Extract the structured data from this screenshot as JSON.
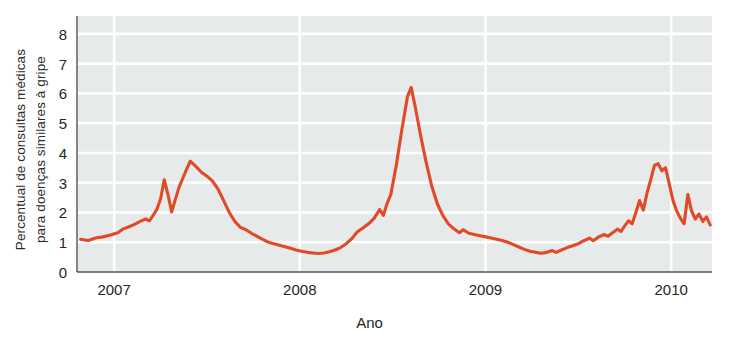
{
  "chart_data": {
    "type": "line",
    "title": "",
    "xlabel": "Ano",
    "ylabel": "Percentual de consultas médicas para doenças similares à gripe",
    "ylabel_line1": "Percentual de consultas médicas",
    "ylabel_line2": "para doenças similares à gripe",
    "ylim": [
      0,
      8.6
    ],
    "xlim": [
      2006.8,
      2010.22
    ],
    "yticks": [
      0,
      1,
      2,
      3,
      4,
      5,
      6,
      7,
      8
    ],
    "ytick_labels": [
      "0",
      "1",
      "2",
      "3",
      "4",
      "5",
      "6",
      "7",
      "8"
    ],
    "xticks": [
      2007,
      2008,
      2009,
      2010
    ],
    "xtick_labels": [
      "2007",
      "2008",
      "2009",
      "2010"
    ],
    "grid": "horizontal-and-vertical-white-on-gray",
    "legend": "none",
    "line_color": "#E04A26",
    "plot_background": "#E7EAEA",
    "gridline_color": "#FFFFFF",
    "series": [
      {
        "name": "Percentual de consultas médicas para doenças similares à gripe",
        "color": "#E04A26",
        "x": [
          2006.82,
          2006.86,
          2006.9,
          2006.94,
          2006.98,
          2007.02,
          2007.06,
          2007.1,
          2007.13,
          2007.17,
          2007.21,
          2007.25,
          2007.27,
          2007.29,
          2007.31,
          2007.34,
          2007.36,
          2007.4,
          2007.44,
          2007.48,
          2007.52,
          2007.56,
          2007.6,
          2007.64,
          2007.68,
          2007.72,
          2007.76,
          2007.8,
          2007.84,
          2007.88,
          2007.92,
          2007.96,
          2008.0,
          2008.04,
          2008.08,
          2008.12,
          2008.16,
          2008.2,
          2008.24,
          2008.27,
          2008.3,
          2008.33,
          2008.36,
          2008.4,
          2008.44,
          2008.48,
          2008.52,
          2008.56,
          2008.6,
          2008.64,
          2008.68,
          2008.72,
          2008.76,
          2008.8,
          2008.84,
          2008.88,
          2008.92,
          2008.96,
          2009.0,
          2009.04,
          2009.08,
          2009.12,
          2009.16,
          2009.2,
          2009.23,
          2009.26,
          2009.29,
          2009.32,
          2009.35,
          2009.38,
          2009.41,
          2009.44,
          2009.47,
          2009.5,
          2009.53,
          2009.56,
          2009.59,
          2009.62,
          2009.65,
          2009.68,
          2009.71,
          2009.74,
          2009.77,
          2009.8,
          2009.83,
          2009.86,
          2009.89,
          2009.92,
          2009.95,
          2009.98,
          2010.01,
          2010.04,
          2010.07,
          2010.1,
          2010.13,
          2010.16,
          2010.19
        ],
        "y": [
          1.1,
          1.08,
          1.12,
          1.18,
          1.22,
          1.3,
          1.42,
          1.55,
          1.62,
          1.72,
          1.8,
          2.05,
          2.4,
          3.1,
          2.55,
          2.05,
          2.75,
          3.3,
          3.72,
          3.45,
          3.2,
          3.05,
          2.65,
          2.2,
          1.7,
          1.42,
          1.3,
          1.18,
          1.05,
          0.95,
          0.88,
          0.8,
          0.72,
          0.68,
          0.64,
          0.62,
          0.66,
          0.72,
          0.8,
          0.92,
          1.1,
          1.35,
          1.5,
          1.72,
          2.08,
          1.92,
          2.35,
          3.5,
          5.1,
          6.2,
          5.2,
          3.9,
          2.7,
          2.05,
          1.65,
          1.42,
          1.3,
          1.38,
          1.22,
          1.15,
          1.1,
          1.05,
          0.98,
          0.88,
          0.78,
          0.7,
          0.66,
          0.62,
          0.64,
          0.7,
          0.66,
          0.72,
          0.8,
          0.85,
          0.92,
          1.0,
          1.12,
          1.05,
          1.18,
          1.25,
          1.2,
          1.32,
          1.42,
          1.38,
          1.52,
          1.7,
          1.62,
          1.95,
          2.35,
          2.05,
          2.6,
          3.05,
          3.55,
          3.62,
          3.4,
          3.48,
          2.95
        ]
      }
    ],
    "series_full": {
      "note": "full trace 2006.82 - 2010.20, weekly-ish sampling",
      "points": [
        [
          2006.82,
          1.1
        ],
        [
          2006.86,
          1.06
        ],
        [
          2006.9,
          1.14
        ],
        [
          2006.94,
          1.18
        ],
        [
          2006.98,
          1.24
        ],
        [
          2007.02,
          1.32
        ],
        [
          2007.05,
          1.45
        ],
        [
          2007.08,
          1.52
        ],
        [
          2007.11,
          1.6
        ],
        [
          2007.14,
          1.7
        ],
        [
          2007.17,
          1.78
        ],
        [
          2007.19,
          1.72
        ],
        [
          2007.21,
          1.9
        ],
        [
          2007.23,
          2.1
        ],
        [
          2007.25,
          2.45
        ],
        [
          2007.27,
          3.1
        ],
        [
          2007.29,
          2.6
        ],
        [
          2007.31,
          2.02
        ],
        [
          2007.33,
          2.45
        ],
        [
          2007.35,
          2.85
        ],
        [
          2007.37,
          3.15
        ],
        [
          2007.39,
          3.45
        ],
        [
          2007.41,
          3.72
        ],
        [
          2007.44,
          3.55
        ],
        [
          2007.47,
          3.35
        ],
        [
          2007.5,
          3.22
        ],
        [
          2007.53,
          3.05
        ],
        [
          2007.56,
          2.78
        ],
        [
          2007.59,
          2.4
        ],
        [
          2007.62,
          2.0
        ],
        [
          2007.65,
          1.7
        ],
        [
          2007.68,
          1.5
        ],
        [
          2007.71,
          1.42
        ],
        [
          2007.74,
          1.3
        ],
        [
          2007.77,
          1.2
        ],
        [
          2007.8,
          1.1
        ],
        [
          2007.83,
          1.0
        ],
        [
          2007.86,
          0.95
        ],
        [
          2007.89,
          0.9
        ],
        [
          2007.92,
          0.85
        ],
        [
          2007.95,
          0.8
        ],
        [
          2007.98,
          0.74
        ],
        [
          2008.01,
          0.7
        ],
        [
          2008.04,
          0.66
        ],
        [
          2008.07,
          0.64
        ],
        [
          2008.1,
          0.62
        ],
        [
          2008.13,
          0.64
        ],
        [
          2008.16,
          0.68
        ],
        [
          2008.19,
          0.74
        ],
        [
          2008.22,
          0.82
        ],
        [
          2008.25,
          0.95
        ],
        [
          2008.28,
          1.12
        ],
        [
          2008.31,
          1.35
        ],
        [
          2008.34,
          1.48
        ],
        [
          2008.37,
          1.62
        ],
        [
          2008.4,
          1.8
        ],
        [
          2008.43,
          2.1
        ],
        [
          2008.45,
          1.9
        ],
        [
          2008.47,
          2.3
        ],
        [
          2008.49,
          2.6
        ],
        [
          2008.52,
          3.6
        ],
        [
          2008.55,
          4.8
        ],
        [
          2008.58,
          5.9
        ],
        [
          2008.6,
          6.2
        ],
        [
          2008.62,
          5.6
        ],
        [
          2008.65,
          4.6
        ],
        [
          2008.68,
          3.7
        ],
        [
          2008.71,
          2.9
        ],
        [
          2008.74,
          2.3
        ],
        [
          2008.77,
          1.9
        ],
        [
          2008.8,
          1.62
        ],
        [
          2008.83,
          1.45
        ],
        [
          2008.86,
          1.32
        ],
        [
          2008.88,
          1.42
        ],
        [
          2008.91,
          1.3
        ],
        [
          2008.94,
          1.26
        ],
        [
          2008.97,
          1.22
        ],
        [
          2009.0,
          1.18
        ],
        [
          2009.03,
          1.14
        ],
        [
          2009.06,
          1.1
        ],
        [
          2009.09,
          1.06
        ],
        [
          2009.12,
          1.0
        ],
        [
          2009.15,
          0.92
        ],
        [
          2009.18,
          0.84
        ],
        [
          2009.21,
          0.76
        ],
        [
          2009.24,
          0.7
        ],
        [
          2009.27,
          0.66
        ],
        [
          2009.3,
          0.63
        ],
        [
          2009.33,
          0.66
        ],
        [
          2009.36,
          0.72
        ],
        [
          2009.38,
          0.66
        ],
        [
          2009.41,
          0.74
        ],
        [
          2009.44,
          0.82
        ],
        [
          2009.47,
          0.88
        ],
        [
          2009.5,
          0.95
        ],
        [
          2009.53,
          1.05
        ],
        [
          2009.56,
          1.14
        ],
        [
          2009.58,
          1.05
        ],
        [
          2009.61,
          1.18
        ],
        [
          2009.64,
          1.26
        ],
        [
          2009.66,
          1.2
        ],
        [
          2009.69,
          1.34
        ],
        [
          2009.71,
          1.44
        ],
        [
          2009.73,
          1.36
        ],
        [
          2009.75,
          1.55
        ],
        [
          2009.77,
          1.72
        ],
        [
          2009.79,
          1.62
        ],
        [
          2009.81,
          2.0
        ],
        [
          2009.83,
          2.4
        ],
        [
          2009.85,
          2.08
        ],
        [
          2009.87,
          2.65
        ],
        [
          2009.89,
          3.1
        ],
        [
          2009.91,
          3.58
        ],
        [
          2009.93,
          3.64
        ],
        [
          2009.95,
          3.4
        ],
        [
          2009.97,
          3.5
        ],
        [
          2009.99,
          2.95
        ],
        [
          2010.01,
          2.4
        ],
        [
          2010.03,
          2.05
        ],
        [
          2010.05,
          1.8
        ],
        [
          2010.07,
          1.62
        ],
        [
          2010.09,
          2.6
        ],
        [
          2010.11,
          2.05
        ],
        [
          2010.13,
          1.78
        ],
        [
          2010.15,
          1.95
        ],
        [
          2010.17,
          1.7
        ],
        [
          2010.19,
          1.85
        ],
        [
          2010.21,
          1.58
        ]
      ]
    },
    "annotations": [
      {
        "label": "pico inverno 2007 (1)",
        "x": 2007.27,
        "y": 3.1
      },
      {
        "label": "vale entre picos 2007",
        "x": 2007.31,
        "y": 2.0
      },
      {
        "label": "pico inverno 2007 (2)",
        "x": 2007.41,
        "y": 3.7
      },
      {
        "label": "vale verão 2007",
        "x": 2008.1,
        "y": 0.6
      },
      {
        "label": "pico inverno 2008",
        "x": 2008.6,
        "y": 6.2
      },
      {
        "label": "vale verão 2008",
        "x": 2009.3,
        "y": 0.6
      },
      {
        "label": "pico inverno 2009",
        "x": 2009.12,
        "y": 3.6
      },
      {
        "label": "pico outono H1N1 2009",
        "x": 2009.8,
        "y": 7.95
      },
      {
        "label": "valor final 2010",
        "x": 2010.2,
        "y": 1.0
      }
    ]
  },
  "axes": {
    "y_title_line1": "Percentual de consultas médicas",
    "y_title_line2": "para doenças similares à gripe",
    "x_title": "Ano"
  }
}
